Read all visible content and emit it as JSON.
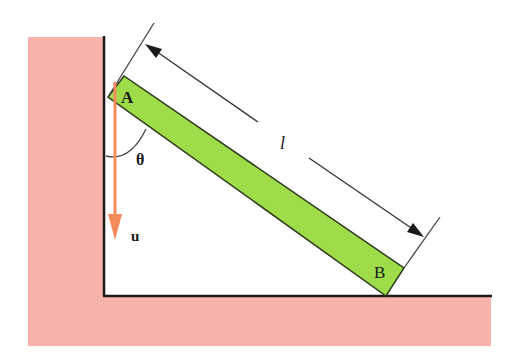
{
  "diagram": {
    "labels": {
      "point_a": "A",
      "point_b": "B",
      "length": "l",
      "angle": "θ",
      "velocity": "u"
    },
    "colors": {
      "wall_fill": "#f7b3ab",
      "rod_fill": "#9fdc4a",
      "rod_stroke": "#2d3a1a",
      "velocity_arrow": "#f58a5a",
      "line": "#1a1a1a",
      "dimension_line": "#333333"
    }
  }
}
